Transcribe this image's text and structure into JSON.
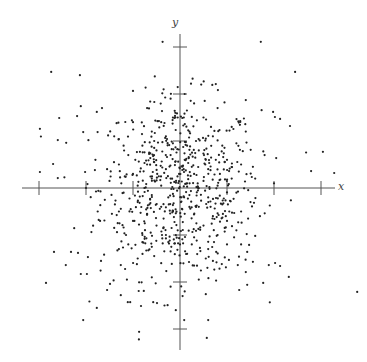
{
  "chart_data": {
    "type": "scatter",
    "title": "",
    "xlabel": "x",
    "ylabel": "y",
    "xlim": [
      -3.3,
      3.3
    ],
    "ylim": [
      -3.4,
      3.3
    ],
    "xticks": [
      -3,
      -2,
      -1,
      1,
      2,
      3
    ],
    "yticks": [
      -3,
      -2,
      -1,
      1,
      2,
      3
    ],
    "tick_labels_shown": false,
    "grid": false,
    "legend": null,
    "point_color": "#222222",
    "axis_color": "#555555",
    "layout": {
      "origin_px": [
        180,
        188
      ],
      "unit_px": 47,
      "x_axis_px": [
        22,
        335
      ],
      "y_axis_px": [
        34,
        350
      ]
    },
    "outlier_points": [
      [
        -2.74,
        2.47
      ],
      [
        -2.13,
        2.4
      ],
      [
        -2.11,
        1.74
      ],
      [
        -2.57,
        1.49
      ],
      [
        -2.19,
        1.53
      ],
      [
        -2.98,
        1.26
      ],
      [
        -2.6,
        1.02
      ],
      [
        -2.06,
        1.19
      ],
      [
        -1.77,
        1.62
      ],
      [
        -1.66,
        1.7
      ],
      [
        -2.7,
        0.51
      ],
      [
        -2.98,
        0.34
      ],
      [
        -2.6,
        0.21
      ],
      [
        -2.02,
        0.34
      ],
      [
        -1.81,
        0.38
      ],
      [
        1.72,
        3.11
      ],
      [
        2.45,
        2.47
      ],
      [
        1.4,
        1.87
      ],
      [
        1.98,
        1.62
      ],
      [
        2.02,
        1.51
      ],
      [
        2.13,
        1.47
      ],
      [
        2.34,
        1.32
      ],
      [
        3.04,
        0.77
      ],
      [
        2.79,
        0.36
      ],
      [
        3.28,
        0.32
      ],
      [
        -2.85,
        -2.02
      ],
      [
        -2.68,
        -1.36
      ],
      [
        -2.32,
        -1.36
      ],
      [
        -2.43,
        -1.64
      ],
      [
        -2.11,
        -1.83
      ],
      [
        -1.98,
        -1.83
      ],
      [
        -2.17,
        -1.38
      ],
      [
        -1.96,
        -1.47
      ],
      [
        -1.68,
        -1.55
      ],
      [
        -1.49,
        -2.04
      ],
      [
        -1.55,
        -2.17
      ],
      [
        -1.77,
        -2.55
      ],
      [
        -2.06,
        -2.81
      ],
      [
        -1.26,
        -2.28
      ],
      [
        -1.11,
        -2.43
      ],
      [
        -1.06,
        -2.43
      ],
      [
        -0.77,
        -2.19
      ],
      [
        -0.83,
        -2.51
      ],
      [
        -0.57,
        -2.43
      ],
      [
        -0.49,
        -2.45
      ],
      [
        -0.09,
        -2.6
      ],
      [
        -0.87,
        -3.06
      ],
      [
        -1.26,
        -1.64
      ],
      [
        0.43,
        -0.89
      ],
      [
        0.77,
        -1.36
      ],
      [
        0.89,
        -1.62
      ],
      [
        1.23,
        -1.64
      ],
      [
        1.43,
        -1.36
      ],
      [
        1.55,
        -1.57
      ],
      [
        1.04,
        -1.53
      ],
      [
        1.43,
        -2.06
      ],
      [
        1.26,
        -2.17
      ],
      [
        1.77,
        -2.02
      ],
      [
        0.6,
        -2.81
      ],
      [
        0.09,
        -2.81
      ],
      [
        0.57,
        -3.19
      ],
      [
        0.55,
        -2.26
      ],
      [
        1.89,
        -1.64
      ],
      [
        2.13,
        -1.66
      ],
      [
        3.77,
        -2.21
      ],
      [
        1.6,
        -1.02
      ],
      [
        1.4,
        -1.79
      ]
    ],
    "core_points": [
      [
        -0.2,
        1.9
      ],
      [
        0.1,
        2.0
      ],
      [
        -0.1,
        1.6
      ],
      [
        0.3,
        1.8
      ],
      [
        -0.4,
        1.4
      ],
      [
        0.5,
        1.5
      ],
      [
        -0.6,
        1.2
      ],
      [
        0.7,
        1.1
      ],
      [
        -0.3,
        1.1
      ],
      [
        0.2,
        1.2
      ],
      [
        -0.8,
        0.9
      ],
      [
        0.9,
        0.9
      ],
      [
        -0.5,
        0.8
      ],
      [
        0.4,
        0.8
      ],
      [
        -1.1,
        0.7
      ],
      [
        1.0,
        0.6
      ],
      [
        -0.2,
        0.7
      ],
      [
        0.1,
        0.6
      ],
      [
        -0.05,
        1.5
      ],
      [
        0.02,
        1.52
      ],
      [
        -0.1,
        1.5
      ],
      [
        -0.12,
        1.49
      ],
      [
        -0.15,
        1.5
      ],
      [
        0.05,
        1.49
      ],
      [
        0.08,
        1.5
      ],
      [
        -1.3,
        0.5
      ],
      [
        1.3,
        0.5
      ],
      [
        -0.7,
        0.5
      ],
      [
        0.6,
        0.4
      ],
      [
        -0.3,
        0.4
      ],
      [
        0.3,
        0.3
      ],
      [
        -1.0,
        0.3
      ],
      [
        1.1,
        0.2
      ],
      [
        -0.6,
        0.2
      ],
      [
        0.5,
        0.15
      ],
      [
        -0.2,
        0.2
      ],
      [
        0.15,
        0.1
      ],
      [
        -1.5,
        0.15
      ],
      [
        1.6,
        0.2
      ],
      [
        -0.9,
        0.05
      ],
      [
        0.8,
        0.05
      ],
      [
        -0.4,
        0.05
      ],
      [
        0.35,
        0.02
      ],
      [
        -1.2,
        -0.1
      ],
      [
        1.2,
        -0.1
      ],
      [
        -0.6,
        -0.15
      ],
      [
        0.6,
        -0.2
      ],
      [
        -0.25,
        -0.2
      ],
      [
        0.2,
        -0.15
      ],
      [
        -1.6,
        -0.25
      ],
      [
        1.5,
        -0.3
      ],
      [
        -0.9,
        -0.3
      ],
      [
        0.9,
        -0.35
      ],
      [
        -0.4,
        -0.4
      ],
      [
        0.4,
        -0.4
      ],
      [
        -1.3,
        -0.5
      ],
      [
        1.3,
        -0.5
      ],
      [
        -0.7,
        -0.55
      ],
      [
        0.7,
        -0.6
      ],
      [
        -0.15,
        -0.5
      ],
      [
        0.1,
        -0.55
      ],
      [
        -1.0,
        -0.7
      ],
      [
        1.0,
        -0.7
      ],
      [
        -0.5,
        -0.8
      ],
      [
        0.5,
        -0.8
      ],
      [
        -1.4,
        -0.85
      ],
      [
        1.2,
        -0.9
      ],
      [
        -0.8,
        -1.0
      ],
      [
        0.8,
        -1.0
      ],
      [
        -0.3,
        -1.0
      ],
      [
        0.3,
        -1.05
      ],
      [
        -1.1,
        -1.2
      ],
      [
        1.0,
        -1.2
      ],
      [
        -0.6,
        -1.25
      ],
      [
        0.6,
        -1.3
      ],
      [
        -0.2,
        -1.35
      ],
      [
        0.15,
        -1.4
      ],
      [
        -0.9,
        -1.5
      ],
      [
        0.7,
        -1.55
      ],
      [
        -0.4,
        -1.6
      ],
      [
        0.3,
        -1.65
      ],
      [
        -0.6,
        -1.9
      ],
      [
        0.4,
        -1.95
      ],
      [
        -0.2,
        -2.1
      ],
      [
        0.1,
        -2.2
      ],
      [
        -0.05,
        -0.9
      ],
      [
        0.02,
        -0.3
      ],
      [
        -0.02,
        0.3
      ],
      [
        0.0,
        -1.2
      ],
      [
        0.01,
        -1.6
      ],
      [
        -1.8,
        0.6
      ],
      [
        1.8,
        0.7
      ],
      [
        -1.7,
        -0.7
      ],
      [
        1.7,
        -0.6
      ],
      [
        -2.0,
        0.0
      ],
      [
        2.0,
        0.1
      ],
      [
        -1.4,
        1.1
      ],
      [
        1.4,
        1.2
      ],
      [
        -1.3,
        -1.3
      ],
      [
        1.3,
        -1.2
      ],
      [
        -0.35,
        2.1
      ],
      [
        0.45,
        2.2
      ],
      [
        -0.7,
        1.7
      ],
      [
        0.8,
        1.7
      ],
      [
        -1.0,
        1.4
      ],
      [
        1.1,
        1.3
      ],
      [
        -1.2,
        0.9
      ],
      [
        1.2,
        0.95
      ],
      [
        -0.55,
        0.55
      ],
      [
        0.55,
        0.6
      ],
      [
        -0.85,
        0.35
      ],
      [
        0.85,
        0.3
      ],
      [
        -0.45,
        0.25
      ],
      [
        0.25,
        0.45
      ],
      [
        -0.65,
        -0.35
      ],
      [
        0.65,
        -0.4
      ],
      [
        -0.35,
        -0.65
      ],
      [
        0.35,
        -0.75
      ],
      [
        -0.75,
        -0.75
      ],
      [
        0.95,
        -0.85
      ],
      [
        -1.05,
        -0.45
      ],
      [
        1.05,
        -0.5
      ],
      [
        -1.25,
        0.1
      ],
      [
        1.25,
        0.35
      ],
      [
        -0.15,
        0.95
      ],
      [
        0.15,
        0.9
      ],
      [
        -0.95,
        0.6
      ],
      [
        0.95,
        0.55
      ],
      [
        -0.55,
        1.0
      ],
      [
        0.55,
        1.05
      ],
      [
        -1.55,
        0.4
      ],
      [
        1.55,
        0.45
      ],
      [
        -1.45,
        -0.55
      ],
      [
        1.45,
        -0.65
      ],
      [
        -0.25,
        -1.15
      ],
      [
        0.25,
        -1.2
      ],
      [
        -0.55,
        -1.45
      ],
      [
        0.55,
        -1.5
      ],
      [
        -1.15,
        -1.0
      ],
      [
        1.15,
        -1.05
      ]
    ]
  }
}
